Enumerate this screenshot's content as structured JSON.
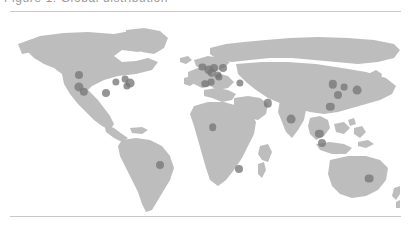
{
  "figure": {
    "caption_text": "Figure 1: Global distribution",
    "background_color": "#ffffff",
    "rule_color": "#c9c9c9"
  },
  "map": {
    "projection": "equirectangular",
    "land_color": "#bdbdbd",
    "ocean_color": "#ffffff",
    "marker_color": "#777777",
    "marker_opacity": 0.78,
    "lon_range": [
      -180,
      180
    ],
    "lat_range": [
      -60,
      84
    ]
  },
  "chart_data": {
    "type": "scatter",
    "title": "Figure 1: Global distribution",
    "xlabel": "Longitude",
    "ylabel": "Latitude",
    "xlim": [
      -180,
      180
    ],
    "ylim": [
      -60,
      84
    ],
    "grid": false,
    "legend": "none",
    "marker_count": 26,
    "points": [
      {
        "name": "Seattle",
        "lon": -122.3,
        "lat": 47.6,
        "size": 4.0
      },
      {
        "name": "San Francisco",
        "lon": -122.4,
        "lat": 37.8,
        "size": 4.6
      },
      {
        "name": "Los Angeles",
        "lon": -118.2,
        "lat": 34.1,
        "size": 4.2
      },
      {
        "name": "Dallas",
        "lon": -96.8,
        "lat": 32.8,
        "size": 4.0
      },
      {
        "name": "Chicago",
        "lon": -87.6,
        "lat": 41.9,
        "size": 3.6
      },
      {
        "name": "Toronto",
        "lon": -79.4,
        "lat": 43.7,
        "size": 3.4
      },
      {
        "name": "New York",
        "lon": -74.0,
        "lat": 40.7,
        "size": 4.4
      },
      {
        "name": "Washington DC",
        "lon": -77.0,
        "lat": 38.9,
        "size": 3.6
      },
      {
        "name": "Sao Paulo",
        "lon": -46.6,
        "lat": -23.5,
        "size": 4.0
      },
      {
        "name": "Dublin",
        "lon": -6.3,
        "lat": 53.3,
        "size": 3.6
      },
      {
        "name": "London",
        "lon": -0.1,
        "lat": 51.5,
        "size": 4.6
      },
      {
        "name": "Amsterdam",
        "lon": 4.9,
        "lat": 52.4,
        "size": 4.0
      },
      {
        "name": "Paris",
        "lon": 2.4,
        "lat": 48.9,
        "size": 4.2
      },
      {
        "name": "Berlin",
        "lon": 13.4,
        "lat": 52.5,
        "size": 4.0
      },
      {
        "name": "Zurich",
        "lon": 8.5,
        "lat": 47.4,
        "size": 3.6
      },
      {
        "name": "Madrid",
        "lon": -3.7,
        "lat": 40.4,
        "size": 3.8
      },
      {
        "name": "Barcelona",
        "lon": 2.2,
        "lat": 41.4,
        "size": 3.4
      },
      {
        "name": "Milan",
        "lon": 9.2,
        "lat": 45.5,
        "size": 3.6
      },
      {
        "name": "Istanbul",
        "lon": 29.0,
        "lat": 41.0,
        "size": 3.6
      },
      {
        "name": "Dubai",
        "lon": 55.3,
        "lat": 25.2,
        "size": 4.2
      },
      {
        "name": "Lagos",
        "lon": 3.4,
        "lat": 6.5,
        "size": 3.8
      },
      {
        "name": "Johannesburg",
        "lon": 28.0,
        "lat": -26.2,
        "size": 4.0
      },
      {
        "name": "Bengaluru",
        "lon": 77.6,
        "lat": 13.0,
        "size": 4.4
      },
      {
        "name": "Beijing",
        "lon": 116.4,
        "lat": 39.9,
        "size": 4.2
      },
      {
        "name": "Shanghai",
        "lon": 121.5,
        "lat": 31.2,
        "size": 4.0
      },
      {
        "name": "Hong Kong",
        "lon": 114.2,
        "lat": 22.3,
        "size": 4.2
      },
      {
        "name": "Tokyo",
        "lon": 139.7,
        "lat": 35.7,
        "size": 4.4
      },
      {
        "name": "Seoul",
        "lon": 127.0,
        "lat": 37.6,
        "size": 3.4
      },
      {
        "name": "Singapore",
        "lon": 103.8,
        "lat": 1.4,
        "size": 4.2
      },
      {
        "name": "Jakarta",
        "lon": 106.8,
        "lat": -6.2,
        "size": 4.0
      },
      {
        "name": "Sydney",
        "lon": 151.2,
        "lat": -33.9,
        "size": 4.4
      }
    ]
  }
}
